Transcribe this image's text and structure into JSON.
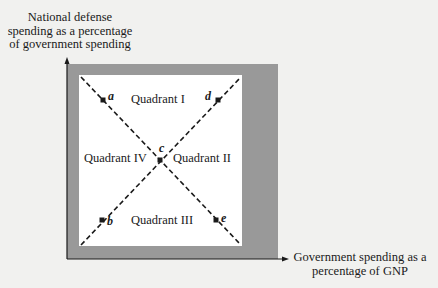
{
  "axes": {
    "y_label_lines": [
      "National defense",
      "spending as a percentage",
      "of government spending"
    ],
    "x_label_lines": [
      "Government spending as a",
      "percentage of GNP"
    ]
  },
  "quadrants": {
    "q1": "Quadrant I",
    "q2": "Quadrant II",
    "q3": "Quadrant III",
    "q4": "Quadrant IV"
  },
  "points": {
    "a": "a",
    "b": "b",
    "c": "c",
    "d": "d",
    "e": "e"
  },
  "colors": {
    "background": "#f1f1ef",
    "frame_band": "#999999",
    "inner_area": "#ffffff",
    "lines": "#1a1a1a"
  }
}
